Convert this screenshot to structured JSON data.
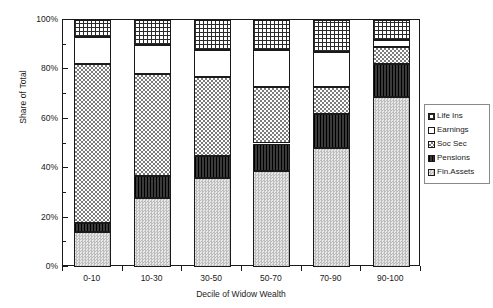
{
  "chart_data": {
    "type": "bar",
    "subtype": "stacked-percent",
    "title": "",
    "xlabel": "Decile of Widow Wealth",
    "ylabel": "Share of Total",
    "categories": [
      "0-10",
      "10-30",
      "30-50",
      "50-70",
      "70-90",
      "90-100"
    ],
    "ylim": [
      0,
      100
    ],
    "ytick_labels": [
      "0%",
      "20%",
      "40%",
      "60%",
      "80%",
      "100%"
    ],
    "ytick_values": [
      0,
      20,
      40,
      60,
      80,
      100
    ],
    "yminor_values": [
      10,
      30,
      50,
      70,
      90
    ],
    "grid": false,
    "legend_position": "right",
    "series": [
      {
        "name": "Fin.Assets",
        "pattern": "fine-checker-light",
        "values": [
          14,
          28,
          36,
          39,
          48,
          69
        ]
      },
      {
        "name": "Pensions",
        "pattern": "solid-dark",
        "values": [
          4,
          9,
          9,
          11,
          14,
          13
        ]
      },
      {
        "name": "Soc Sec",
        "pattern": "coarse-checker",
        "values": [
          64,
          41,
          32,
          23,
          11,
          7
        ]
      },
      {
        "name": "Earnings",
        "pattern": "white",
        "values": [
          11,
          12,
          11,
          15,
          14,
          3
        ]
      },
      {
        "name": "Life Ins",
        "pattern": "grid-crosshatch",
        "values": [
          7,
          10,
          12,
          12,
          13,
          8
        ]
      }
    ],
    "stack_order_bottom_to_top": [
      "Fin.Assets",
      "Pensions",
      "Soc Sec",
      "Earnings",
      "Life Ins"
    ],
    "cumulative_tops": {
      "0-10": {
        "Fin.Assets": 14,
        "Pensions": 18,
        "Soc Sec": 82,
        "Earnings": 93,
        "Life Ins": 100
      },
      "10-30": {
        "Fin.Assets": 28,
        "Pensions": 37,
        "Soc Sec": 78,
        "Earnings": 90,
        "Life Ins": 100
      },
      "30-50": {
        "Fin.Assets": 36,
        "Pensions": 45,
        "Soc Sec": 77,
        "Earnings": 88,
        "Life Ins": 100
      },
      "50-70": {
        "Fin.Assets": 39,
        "Pensions": 50,
        "Soc Sec": 73,
        "Earnings": 88,
        "Life Ins": 100
      },
      "70-90": {
        "Fin.Assets": 48,
        "Pensions": 62,
        "Soc Sec": 73,
        "Earnings": 87,
        "Life Ins": 100
      },
      "90-100": {
        "Fin.Assets": 69,
        "Pensions": 82,
        "Soc Sec": 89,
        "Earnings": 92,
        "Life Ins": 100
      }
    }
  },
  "legend": {
    "entries": [
      {
        "label": "Life Ins"
      },
      {
        "label": "Earnings"
      },
      {
        "label": "Soc Sec"
      },
      {
        "label": "Pensions"
      },
      {
        "label": "Fin.Assets"
      }
    ]
  }
}
